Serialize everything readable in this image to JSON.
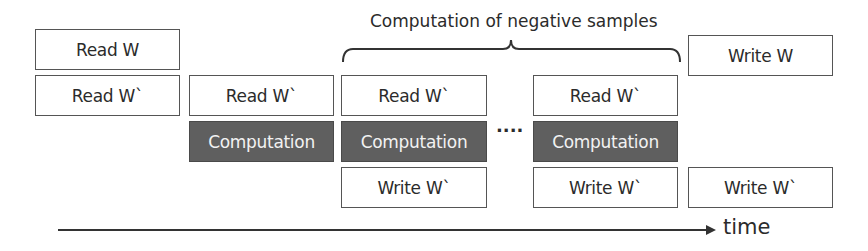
{
  "title": "Computation of negative samples",
  "dots": "····",
  "axis_label": "time",
  "colors": {
    "computation_fill": "#5f5f5f",
    "border": "#555555",
    "text": "#2b2b2b"
  },
  "columns": [
    {
      "blocks": [
        {
          "label": "Read W"
        },
        {
          "label": "Read W`"
        }
      ]
    },
    {
      "blocks": [
        {
          "label": "Read W`"
        },
        {
          "label": "Computation"
        }
      ]
    },
    {
      "blocks": [
        {
          "label": "Read W`"
        },
        {
          "label": "Computation"
        },
        {
          "label": "Write W`"
        }
      ]
    },
    {
      "blocks": [
        {
          "label": "Read W`"
        },
        {
          "label": "Computation"
        },
        {
          "label": "Write W`"
        }
      ]
    },
    {
      "blocks": [
        {
          "label": "Write W"
        },
        {
          "label": "Write W`"
        }
      ]
    }
  ]
}
